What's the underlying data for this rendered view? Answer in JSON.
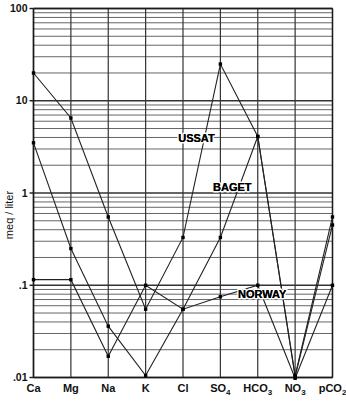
{
  "chart_data": {
    "type": "line",
    "title": "",
    "xlabel": "",
    "ylabel": "meq / liter",
    "yscale": "log",
    "ylim": [
      0.01,
      100
    ],
    "grid": true,
    "grid_style": "log-minor-horizontal + major-vertical",
    "legend_position": "inline-annotation",
    "categories": [
      "Ca",
      "Mg",
      "Na",
      "K",
      "Cl",
      "SO4",
      "HCO3",
      "NO3",
      "pCO2"
    ],
    "category_labels": [
      {
        "base": "Ca",
        "sub": ""
      },
      {
        "base": "Mg",
        "sub": ""
      },
      {
        "base": "Na",
        "sub": ""
      },
      {
        "base": "K",
        "sub": ""
      },
      {
        "base": "Cl",
        "sub": ""
      },
      {
        "base": "SO",
        "sub": "4"
      },
      {
        "base": "HCO",
        "sub": "3"
      },
      {
        "base": "NO",
        "sub": "3"
      },
      {
        "base": "pCO",
        "sub": "2"
      }
    ],
    "ytick_labels": [
      "100",
      "10",
      "1",
      ".1",
      ".01"
    ],
    "ytick_values": [
      100,
      10,
      1,
      0.1,
      0.01
    ],
    "series": [
      {
        "name": "USSAT",
        "values": [
          20.0,
          6.5,
          0.55,
          0.055,
          0.33,
          25.0,
          4.1,
          0.0105,
          0.55
        ]
      },
      {
        "name": "BAGET",
        "values": [
          3.5,
          0.25,
          0.036,
          0.0105,
          0.055,
          0.33,
          4.1,
          0.0102,
          0.45
        ]
      },
      {
        "name": "NORWAY",
        "values": [
          0.115,
          0.115,
          0.017,
          0.1,
          0.055,
          0.075,
          0.1,
          0.0098,
          0.1
        ]
      }
    ],
    "annotations": [
      {
        "text": "USSAT",
        "x_frac": 0.545,
        "y_value": 3.6
      },
      {
        "text": "BAGET",
        "x_frac": 0.665,
        "y_value": 1.05
      },
      {
        "text": "NORWAY",
        "x_frac": 0.765,
        "y_value": 0.073
      }
    ]
  },
  "colors": {
    "axis": "#1a1a1a",
    "grid_major": "#333333",
    "grid_minor": "#555555",
    "series_line": "#222222",
    "marker": "#000000",
    "background": "#ffffff"
  },
  "axis": {
    "y_title": "meq / liter"
  }
}
